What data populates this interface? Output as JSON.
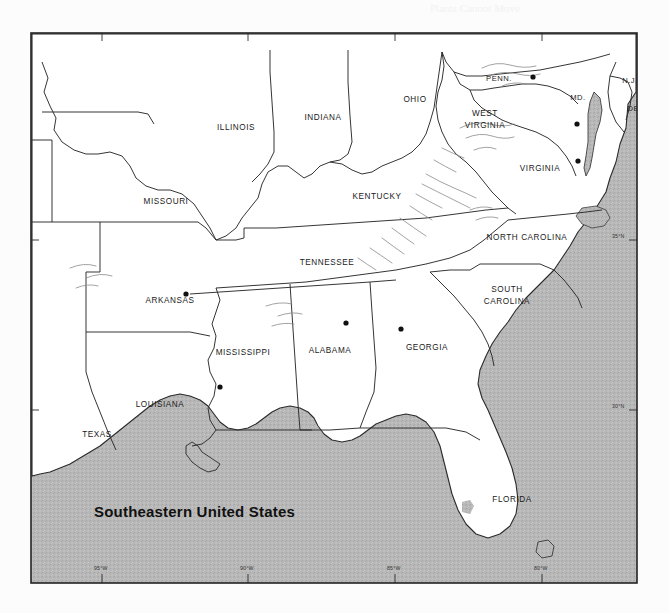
{
  "page": {
    "background_color": "#fcfcfc",
    "bleed_through_text": [
      {
        "text": "Plants Cannot Move",
        "x": 430,
        "y": 12
      },
      {
        "text": "Because They Cannot Move",
        "x": 392,
        "y": 352
      }
    ]
  },
  "figure": {
    "title": "Southeastern United States",
    "frame_color": "#222222",
    "land_color": "#ffffff",
    "water_color": "#b5b5b5",
    "border_color": "#2a2a2a",
    "city_dot_color": "#111111",
    "relief_color": "#7a7a7a"
  },
  "graticule": {
    "longitude_labels": [
      {
        "label": "95°W",
        "x": 72
      },
      {
        "label": "90°W",
        "x": 218
      },
      {
        "label": "85°W",
        "x": 365
      },
      {
        "label": "80°W",
        "x": 512
      }
    ],
    "latitude_labels": [
      {
        "label": "35°N",
        "y": 208
      },
      {
        "label": "30°N",
        "y": 378
      }
    ]
  },
  "states": [
    {
      "name": "ILLINOIS",
      "label": "ILLINOIS",
      "x": 206,
      "y": 98,
      "lines": [
        "ILLINOIS"
      ]
    },
    {
      "name": "INDIANA",
      "label": "INDIANA",
      "x": 293,
      "y": 88,
      "lines": [
        "INDIANA"
      ]
    },
    {
      "name": "OHIO",
      "label": "OHIO",
      "x": 385,
      "y": 70,
      "lines": [
        "OHIO"
      ]
    },
    {
      "name": "MISSOURI",
      "label": "MISSOURI",
      "x": 136,
      "y": 172,
      "lines": [
        "MISSOURI"
      ]
    },
    {
      "name": "KENTUCKY",
      "label": "KENTUCKY",
      "x": 347,
      "y": 167,
      "lines": [
        "KENTUCKY"
      ]
    },
    {
      "name": "TENNESSEE",
      "label": "TENNESSEE",
      "x": 297,
      "y": 233,
      "lines": [
        "TENNESSEE"
      ]
    },
    {
      "name": "ARKANSAS",
      "label": "ARKANSAS",
      "x": 140,
      "y": 271,
      "lines": [
        "ARKANSAS"
      ]
    },
    {
      "name": "MISSISSIPPI",
      "label": "MISSISSIPPI",
      "x": 213,
      "y": 323,
      "lines": [
        "MISSISSIPPI"
      ]
    },
    {
      "name": "ALABAMA",
      "label": "ALABAMA",
      "x": 300,
      "y": 321,
      "lines": [
        "ALABAMA"
      ]
    },
    {
      "name": "LOUISIANA",
      "label": "LOUISIANA",
      "x": 130,
      "y": 375,
      "lines": [
        "LOUISIANA"
      ]
    },
    {
      "name": "TEXAS",
      "label": "TEXAS",
      "x": 67,
      "y": 405,
      "lines": [
        "TEXAS"
      ]
    },
    {
      "name": "GEORGIA",
      "label": "GEORGIA",
      "x": 397,
      "y": 318,
      "lines": [
        "GEORGIA"
      ]
    },
    {
      "name": "FLORIDA",
      "label": "FLORIDA",
      "x": 482,
      "y": 470,
      "lines": [
        "FLORIDA"
      ]
    },
    {
      "name": "NORTH CAROLINA",
      "label": "NORTH CAROLINA",
      "x": 497,
      "y": 208,
      "lines": [
        "NORTH CAROLINA"
      ]
    },
    {
      "name": "SOUTH CAROLINA",
      "label": "SOUTH CAROLINA",
      "x": 477,
      "y": 265,
      "lines": [
        "SOUTH",
        "CAROLINA"
      ]
    },
    {
      "name": "WEST VIRGINIA",
      "label": "WEST VIRGINIA",
      "x": 455,
      "y": 88,
      "lines": [
        "WEST",
        "VIRGINIA"
      ]
    },
    {
      "name": "VIRGINIA",
      "label": "VIRGINIA",
      "x": 510,
      "y": 139,
      "lines": [
        "VIRGINIA"
      ]
    },
    {
      "name": "PENN.",
      "label": "PENN.",
      "x": 469,
      "y": 49,
      "lines": [
        "PENN."
      ]
    },
    {
      "name": "MD.",
      "label": "MD.",
      "x": 548,
      "y": 68,
      "lines": [
        "MD."
      ]
    },
    {
      "name": "N.J.",
      "label": "N.J.",
      "x": 600,
      "y": 51,
      "lines": [
        "N.J."
      ]
    },
    {
      "name": "DEL.",
      "label": "DEL.",
      "x": 607,
      "y": 79,
      "lines": [
        "DEL."
      ]
    }
  ],
  "cities": [
    {
      "name": "city-dot-pennsylvania",
      "x": 503,
      "y": 45
    },
    {
      "name": "city-dot-virginia-north",
      "x": 548,
      "y": 129
    },
    {
      "name": "city-dot-virginia-south",
      "x": 547,
      "y": 92
    },
    {
      "name": "city-dot-tennessee-west",
      "x": 156,
      "y": 262
    },
    {
      "name": "city-dot-alabama",
      "x": 316,
      "y": 291
    },
    {
      "name": "city-dot-mississippi",
      "x": 190,
      "y": 355
    },
    {
      "name": "city-dot-georgia",
      "x": 371,
      "y": 297
    }
  ],
  "legend": {
    "region_name": "Southeastern United States"
  }
}
